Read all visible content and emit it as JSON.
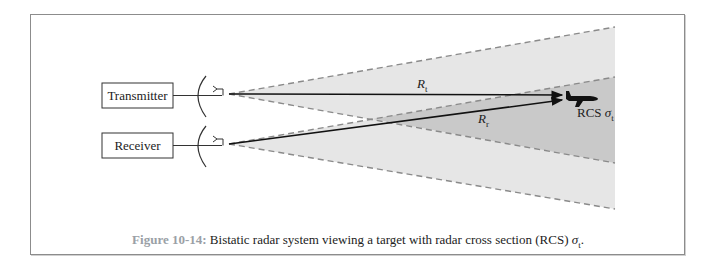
{
  "figure": {
    "blocks": {
      "transmitter": "Transmitter",
      "receiver": "Receiver"
    },
    "labels": {
      "range_transmit": "R",
      "range_transmit_sub": "t",
      "range_receive": "R",
      "range_receive_sub": "r",
      "target_prefix": "RCS ",
      "target_symbol": "σ",
      "target_sub": "t"
    },
    "caption": {
      "number": "Figure 10-14:",
      "text": " Bistatic radar system viewing a target with radar cross section (RCS) ",
      "symbol": "σ",
      "symbol_sub": "t",
      "end": "."
    },
    "colors": {
      "beam_fill": "#e4e4e4",
      "overlap_fill": "#c8c8c8",
      "beam_edge": "#8a8a8a",
      "caption_number": "#9aa0a6"
    }
  }
}
